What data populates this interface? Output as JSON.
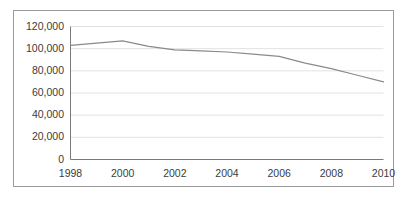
{
  "figure": {
    "background_color": "#ffffff",
    "border_color": "#9a9a9a",
    "axis_color": "#7a7a7a",
    "gridline_color": "#e2e2e2",
    "line_color": "#8a8a8a",
    "tick_text_color": "#3b3b3b"
  },
  "chart_data": {
    "type": "line",
    "title": "",
    "subtitle": "",
    "xlabel": "",
    "ylabel": "",
    "x": [
      1998,
      1999,
      2000,
      2001,
      2002,
      2003,
      2004,
      2005,
      2006,
      2007,
      2008,
      2009,
      2010
    ],
    "categories": [
      "1998",
      "1999",
      "2000",
      "2001",
      "2002",
      "2003",
      "2004",
      "2005",
      "2006",
      "2007",
      "2008",
      "2009",
      "2010"
    ],
    "values": [
      103000,
      105000,
      107000,
      102000,
      99000,
      98000,
      97000,
      95000,
      93000,
      87000,
      82000,
      76000,
      70000
    ],
    "series": [
      {
        "name": "",
        "values": [
          103000,
          105000,
          107000,
          102000,
          99000,
          98000,
          97000,
          95000,
          93000,
          87000,
          82000,
          76000,
          70000
        ]
      }
    ],
    "xlim": [
      1998,
      2010
    ],
    "ylim": [
      0,
      120000
    ],
    "ytick_values": [
      0,
      20000,
      40000,
      60000,
      80000,
      100000,
      120000
    ],
    "ytick_labels": [
      "0",
      "20,000",
      "40,000",
      "60,000",
      "80,000",
      "100,000",
      "120,000"
    ],
    "xtick_values": [
      1998,
      2000,
      2002,
      2004,
      2006,
      2008,
      2010
    ],
    "xtick_labels": [
      "1998",
      "2000",
      "2002",
      "2004",
      "2006",
      "2008",
      "2010"
    ],
    "grid": true,
    "grid_axis": "y",
    "legend": false,
    "legend_position": "none",
    "markers": false,
    "annotations": []
  }
}
